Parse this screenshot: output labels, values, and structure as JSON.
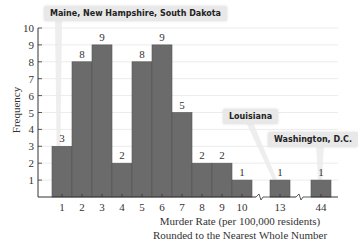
{
  "chart_data": {
    "type": "bar",
    "title": "",
    "xlabel": "Murder Rate (per 100,000 residents)",
    "xlabel_line2": "Rounded to the Nearest Whole Number",
    "ylabel": "Frequency",
    "ylim": [
      0,
      10
    ],
    "yticks": [
      1,
      2,
      3,
      4,
      5,
      6,
      7,
      8,
      9,
      10
    ],
    "grid": true,
    "categories": [
      "1",
      "2",
      "3",
      "4",
      "5",
      "6",
      "7",
      "8",
      "9",
      "10",
      "13",
      "44"
    ],
    "values": [
      3,
      8,
      9,
      2,
      8,
      9,
      5,
      2,
      2,
      1,
      1,
      1
    ],
    "axis_breaks": [
      "between 10 and 13",
      "between 13 and 44"
    ],
    "annotations": [
      {
        "text": "Maine, New Hampshire, South Dakota",
        "points_to": "1"
      },
      {
        "text": "Louisiana",
        "points_to": "13"
      },
      {
        "text": "Washington, D.C.",
        "points_to": "44"
      }
    ],
    "bar_color": "#6b6b6b"
  },
  "labels": {
    "ylabel": "Frequency",
    "xlabel1": "Murder Rate (per 100,000 residents)",
    "xlabel2": "Rounded to the Nearest Whole Number",
    "callout1": "Maine, New Hampshire, South Dakota",
    "callout2": "Louisiana",
    "callout3": "Washington, D.C."
  }
}
